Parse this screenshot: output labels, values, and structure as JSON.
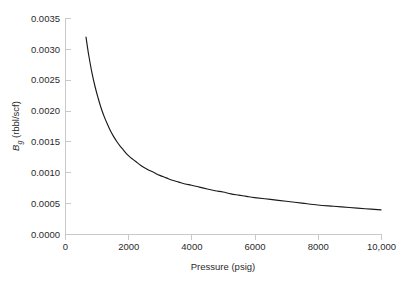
{
  "figure": {
    "background_color": "#ffffff",
    "axis_color": "#c9c9c9",
    "curve_color": "#1a1a1a",
    "tick_label_color": "#2b2b2b"
  },
  "axes": {
    "x_title": "Pressure (psig)",
    "y_title_parts": {
      "symbol": "B",
      "subscript": "g",
      "units": " (rbbl/scf)"
    },
    "y_title_full": "Bg (rbbl/scf)",
    "x_tick_labels": [
      "0",
      "2000",
      "4000",
      "6000",
      "8000",
      "10,000"
    ],
    "y_tick_labels": [
      "0.0000",
      "0.0005",
      "0.0010",
      "0.0015",
      "0.0020",
      "0.0025",
      "0.0030",
      "0.0035"
    ]
  },
  "chart_data": {
    "type": "line",
    "title": "",
    "subtitle": "",
    "xlabel": "Pressure (psig)",
    "ylabel": "Bg (rbbl/scf)",
    "xlim": [
      0,
      10000
    ],
    "ylim": [
      0,
      0.0035
    ],
    "xticks": [
      0,
      2000,
      4000,
      6000,
      8000,
      10000
    ],
    "xtick_labels": [
      "0",
      "2000",
      "4000",
      "6000",
      "8000",
      "10,000"
    ],
    "yticks": [
      0.0,
      0.0005,
      0.001,
      0.0015,
      0.002,
      0.0025,
      0.003,
      0.0035
    ],
    "ytick_labels": [
      "0.0000",
      "0.0005",
      "0.0010",
      "0.0015",
      "0.0020",
      "0.0025",
      "0.0030",
      "0.0035"
    ],
    "grid": false,
    "legend": null,
    "legend_position": "none",
    "annotations": [],
    "series": [
      {
        "name": "Gas formation volume factor",
        "color": "#1a1a1a",
        "x": [
          665,
          750,
          850,
          950,
          1050,
          1150,
          1250,
          1350,
          1450,
          1550,
          1650,
          1750,
          1850,
          1950,
          2050,
          2150,
          2250,
          2400,
          2600,
          2800,
          3000,
          3200,
          3400,
          3600,
          3800,
          4000,
          4250,
          4500,
          4750,
          5000,
          5250,
          5500,
          5750,
          6000,
          6500,
          7000,
          7500,
          8000,
          8500,
          9000,
          9500,
          10000
        ],
        "y": [
          0.00319,
          0.0029,
          0.00262,
          0.00239,
          0.0022,
          0.00203,
          0.00189,
          0.00177,
          0.00166,
          0.00157,
          0.00149,
          0.00142,
          0.00136,
          0.0013,
          0.00125,
          0.00121,
          0.00117,
          0.00111,
          0.00105,
          0.001,
          0.00095,
          0.00091,
          0.00087,
          0.00084,
          0.00081,
          0.00079,
          0.00076,
          0.00073,
          0.0007,
          0.00068,
          0.00065,
          0.00063,
          0.00061,
          0.00059,
          0.00056,
          0.00053,
          0.0005,
          0.00047,
          0.00045,
          0.00043,
          0.00041,
          0.00039
        ]
      }
    ]
  },
  "geometry": {
    "plot_left_px": 65,
    "plot_right_px": 381,
    "plot_top_px": 18,
    "plot_bottom_px": 234
  }
}
